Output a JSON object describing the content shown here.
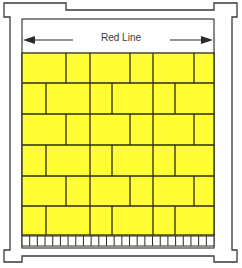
{
  "diagram": {
    "title": "Red Line",
    "colors": {
      "tile": "#ffff33",
      "grout": "#2b2b1a",
      "frame": "#3a3a3a",
      "background": "#ffffff",
      "arrow": "#2a2a2a"
    },
    "frame": {
      "outer_path": "M4,3 H66 V10 H214 V3 H237 V17 H232 V250 H237 V262 H214 V256 H22 V262 H4 V250 H10 V17 H4 Z",
      "inner_rect": {
        "x": 22,
        "y": 19,
        "w": 192,
        "h": 229
      }
    },
    "dimension": {
      "label": "Red Line",
      "y": 40,
      "left_arrow": {
        "x1": 23,
        "x2": 73
      },
      "right_arrow": {
        "x1": 170,
        "x2": 213
      }
    },
    "tiles": {
      "x0": 22,
      "x1": 214,
      "row_edges": [
        53,
        83,
        114,
        145,
        176,
        206,
        235
      ],
      "pattern_a_joints": [
        66,
        90,
        130,
        153,
        194
      ],
      "pattern_b_joints": [
        46,
        90,
        112,
        153,
        175
      ],
      "row_patterns": [
        "a",
        "b",
        "a",
        "b",
        "a",
        "b"
      ]
    },
    "ruler": {
      "y0": 236,
      "y1": 246,
      "cells": 25
    }
  }
}
